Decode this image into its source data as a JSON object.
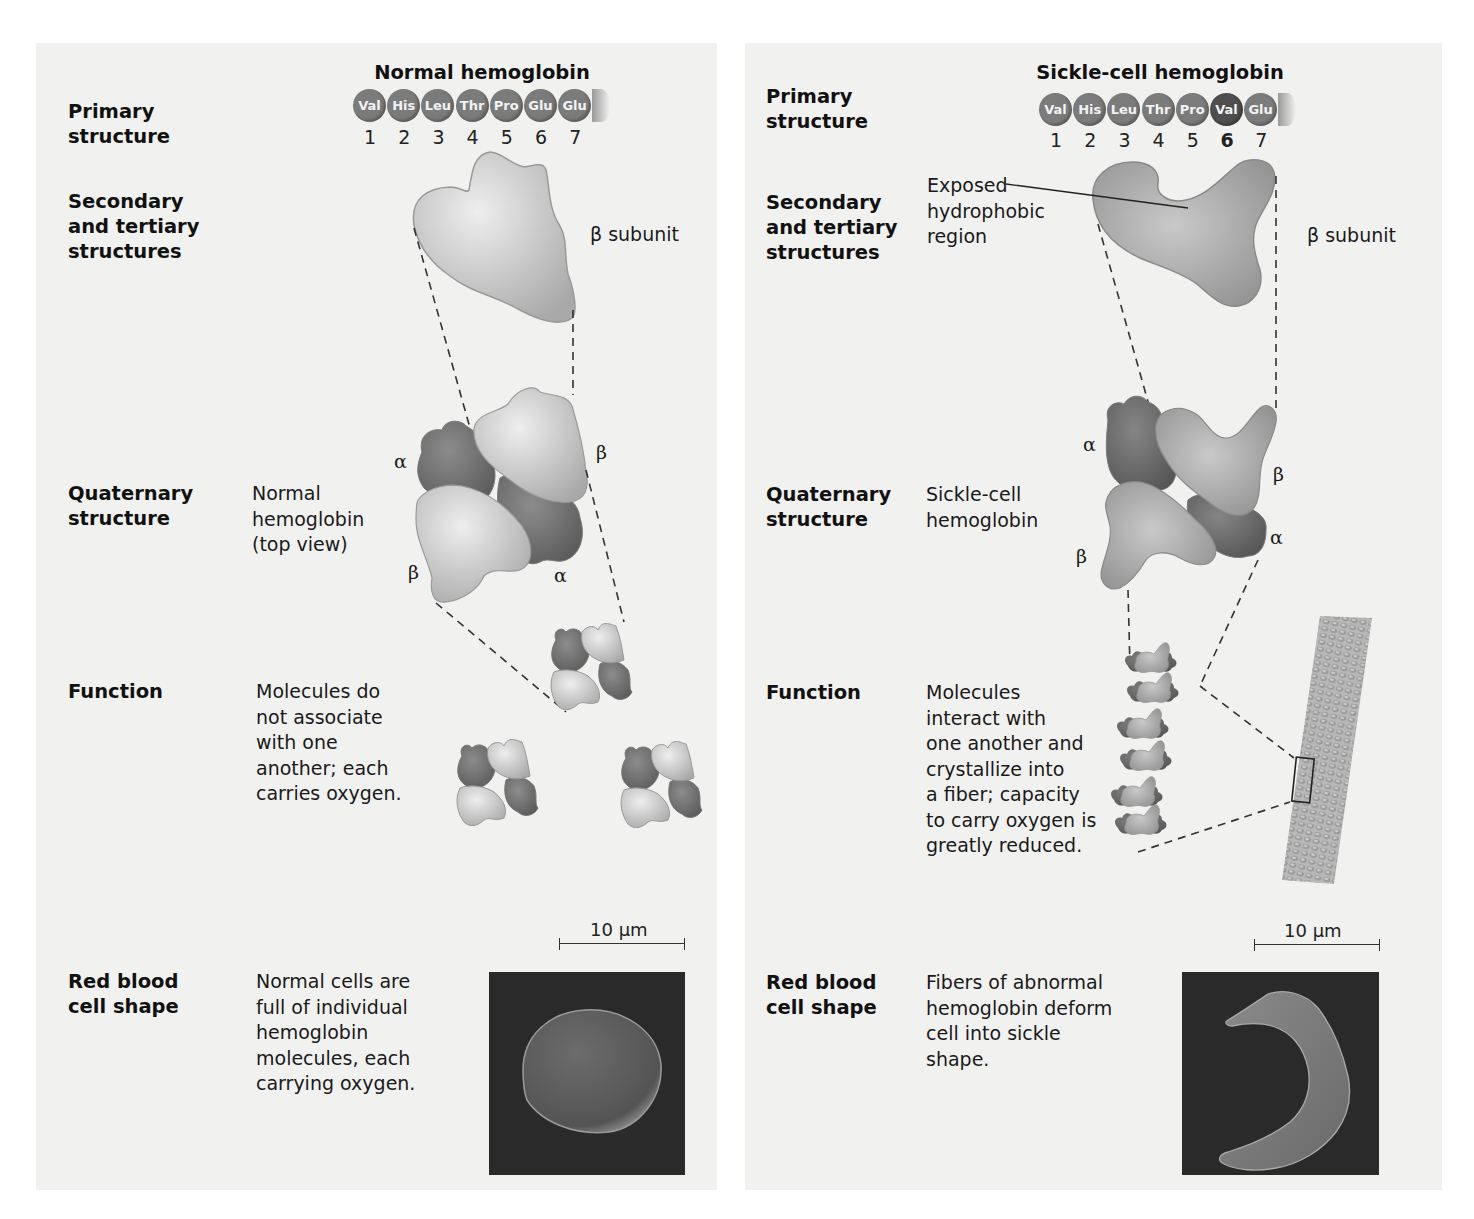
{
  "left": {
    "title": "Normal hemoglobin",
    "amino_acids": [
      {
        "code": "Val",
        "pos": "1"
      },
      {
        "code": "His",
        "pos": "2"
      },
      {
        "code": "Leu",
        "pos": "3"
      },
      {
        "code": "Thr",
        "pos": "4"
      },
      {
        "code": "Pro",
        "pos": "5"
      },
      {
        "code": "Glu",
        "pos": "6"
      },
      {
        "code": "Glu",
        "pos": "7"
      }
    ],
    "rows": {
      "primary": "Primary\nstructure",
      "secondary": "Secondary\nand tertiary\nstructures",
      "quaternary": "Quaternary\nstructure",
      "function": "Function",
      "rbc": "Red blood\ncell shape"
    },
    "beta_subunit_label": "β subunit",
    "quaternary_desc": "Normal\nhemoglobin\n(top view)",
    "subunit_labels": {
      "alpha_top": "α",
      "beta_top": "β",
      "beta_bottom": "β",
      "alpha_bottom": "α"
    },
    "function_desc": "Molecules do\nnot associate\nwith one\nanother; each\ncarries oxygen.",
    "scale": "10 µm",
    "rbc_desc": "Normal cells are\nfull of individual\nhemoglobin\nmolecules, each\ncarrying oxygen."
  },
  "right": {
    "title": "Sickle-cell hemoglobin",
    "amino_acids": [
      {
        "code": "Val",
        "pos": "1"
      },
      {
        "code": "His",
        "pos": "2"
      },
      {
        "code": "Leu",
        "pos": "3"
      },
      {
        "code": "Thr",
        "pos": "4"
      },
      {
        "code": "Pro",
        "pos": "5"
      },
      {
        "code": "Val",
        "pos": "6",
        "mutated": true
      },
      {
        "code": "Glu",
        "pos": "7"
      }
    ],
    "rows": {
      "primary": "Primary\nstructure",
      "secondary": "Secondary\nand tertiary\nstructures",
      "quaternary": "Quaternary\nstructure",
      "function": "Function",
      "rbc": "Red blood\ncell shape"
    },
    "exposed_label": "Exposed\nhydrophobic\nregion",
    "beta_subunit_label": "β subunit",
    "quaternary_desc": "Sickle-cell\nhemoglobin",
    "subunit_labels": {
      "alpha_top": "α",
      "beta_right": "β",
      "beta_bottom": "β",
      "alpha_right": "α"
    },
    "function_desc": "Molecules\ninteract with\none another and\ncrystallize into\na fiber; capacity\nto carry oxygen is\ngreatly reduced.",
    "scale": "10 µm",
    "rbc_desc": "Fibers of abnormal\nhemoglobin deform\ncell into sickle\nshape."
  }
}
